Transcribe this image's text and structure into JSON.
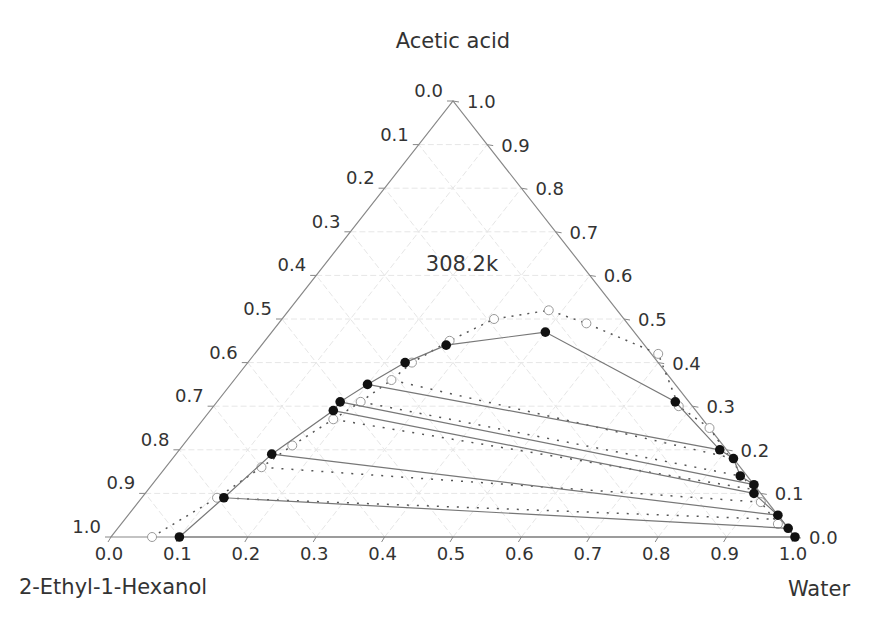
{
  "chart_data": {
    "type": "scatter",
    "subtype": "ternary",
    "title": "",
    "annotation": "308.2k",
    "vertices": {
      "top": "Acetic acid",
      "bottom_left": "2-Ethyl-1-Hexanol",
      "bottom_right": "Water"
    },
    "axes": {
      "bottom": {
        "component": "Water",
        "ticks": [
          "0.0",
          "0.1",
          "0.2",
          "0.3",
          "0.4",
          "0.5",
          "0.6",
          "0.7",
          "0.8",
          "0.9",
          "1.0"
        ]
      },
      "left": {
        "component": "2-Ethyl-1-Hexanol",
        "ticks": [
          "0.0",
          "0.1",
          "0.2",
          "0.3",
          "0.4",
          "0.5",
          "0.6",
          "0.7",
          "0.8",
          "0.9",
          "1.0"
        ]
      },
      "right": {
        "component": "Acetic acid",
        "ticks": [
          "1.0",
          "0.9",
          "0.8",
          "0.7",
          "0.6",
          "0.5",
          "0.4",
          "0.3",
          "0.2",
          "0.1",
          "0.0"
        ]
      }
    },
    "grid": true,
    "series": [
      {
        "name": "Experimental binodal / tie-line ends (filled)",
        "marker": "filled-circle",
        "points_acid_water": [
          [
            0.0,
            0.1
          ],
          [
            0.09,
            0.12
          ],
          [
            0.19,
            0.14
          ],
          [
            0.29,
            0.18
          ],
          [
            0.31,
            0.18
          ],
          [
            0.35,
            0.2
          ],
          [
            0.4,
            0.23
          ],
          [
            0.44,
            0.27
          ],
          [
            0.47,
            0.4
          ],
          [
            0.31,
            0.67
          ],
          [
            0.2,
            0.79
          ],
          [
            0.18,
            0.82
          ],
          [
            0.14,
            0.85
          ],
          [
            0.12,
            0.88
          ],
          [
            0.1,
            0.89
          ],
          [
            0.05,
            0.95
          ],
          [
            0.02,
            0.98
          ],
          [
            0.0,
            1.0
          ]
        ]
      },
      {
        "name": "Calculated binodal (open)",
        "marker": "open-circle",
        "points_acid_water": [
          [
            0.0,
            0.06
          ],
          [
            0.09,
            0.11
          ],
          [
            0.16,
            0.14
          ],
          [
            0.21,
            0.16
          ],
          [
            0.27,
            0.19
          ],
          [
            0.31,
            0.21
          ],
          [
            0.36,
            0.23
          ],
          [
            0.4,
            0.24
          ],
          [
            0.45,
            0.27
          ],
          [
            0.5,
            0.31
          ],
          [
            0.52,
            0.38
          ],
          [
            0.49,
            0.45
          ],
          [
            0.42,
            0.59
          ],
          [
            0.3,
            0.68
          ],
          [
            0.25,
            0.75
          ],
          [
            0.08,
            0.91
          ],
          [
            0.03,
            0.96
          ]
        ]
      }
    ],
    "tie_lines_experimental": [
      [
        [
          0.0,
          0.1
        ],
        [
          0.0,
          1.0
        ]
      ],
      [
        [
          0.09,
          0.12
        ],
        [
          0.02,
          0.98
        ]
      ],
      [
        [
          0.19,
          0.14
        ],
        [
          0.05,
          0.95
        ]
      ],
      [
        [
          0.29,
          0.18
        ],
        [
          0.1,
          0.89
        ]
      ],
      [
        [
          0.31,
          0.18
        ],
        [
          0.12,
          0.88
        ]
      ],
      [
        [
          0.35,
          0.2
        ],
        [
          0.2,
          0.79
        ]
      ]
    ],
    "tie_lines_calculated": [
      [
        [
          0.09,
          0.11
        ],
        [
          0.04,
          0.96
        ]
      ],
      [
        [
          0.16,
          0.14
        ],
        [
          0.08,
          0.91
        ]
      ],
      [
        [
          0.27,
          0.19
        ],
        [
          0.11,
          0.88
        ]
      ],
      [
        [
          0.31,
          0.21
        ],
        [
          0.14,
          0.85
        ]
      ],
      [
        [
          0.36,
          0.23
        ],
        [
          0.18,
          0.82
        ]
      ]
    ]
  }
}
